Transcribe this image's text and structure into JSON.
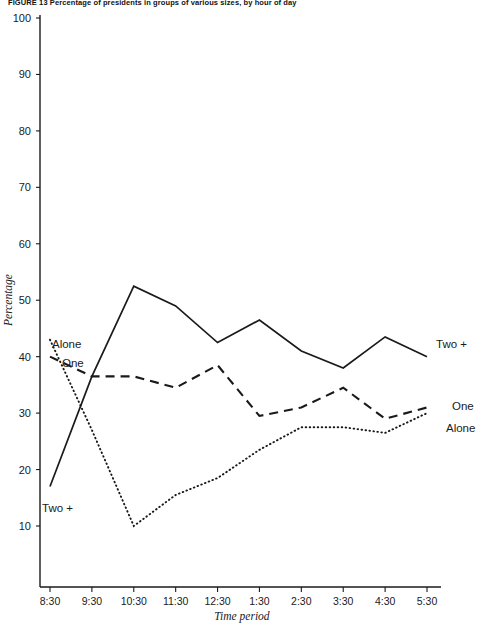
{
  "figure": {
    "caption": "FIGURE 13   Percentage of presidents in groups of various sizes, by hour of day"
  },
  "axes": {
    "y_title": "Percentage",
    "x_title": "Time period",
    "y_ticks": [
      "100",
      "90",
      "80",
      "70",
      "60",
      "50",
      "40",
      "30",
      "20",
      "10"
    ],
    "x_ticks": [
      "8:30",
      "9:30",
      "10:30",
      "11:30",
      "12:30",
      "1:30",
      "2:30",
      "3:30",
      "4:30",
      "5:30"
    ]
  },
  "labels": {
    "alone_left": "Alone",
    "one_left": "One",
    "twoplus_left": "Two +",
    "twoplus_right": "Two +",
    "one_right": "One",
    "alone_right": "Alone"
  },
  "chart_data": {
    "type": "line",
    "title": "FIGURE 13   Percentage of presidents in groups of various sizes, by hour of day",
    "xlabel": "Time period",
    "ylabel": "Percentage",
    "ylim": [
      0,
      100
    ],
    "ytick_step": 10,
    "grid": false,
    "legend": "inline-endpoint-labels",
    "categories": [
      "8:30",
      "9:30",
      "10:30",
      "11:30",
      "12:30",
      "1:30",
      "2:30",
      "3:30",
      "4:30",
      "5:30"
    ],
    "series": [
      {
        "name": "Two +",
        "style": "solid",
        "values": [
          17,
          36.5,
          52.5,
          49,
          42.5,
          46.5,
          41,
          38,
          43.5,
          40
        ]
      },
      {
        "name": "One",
        "style": "dashed",
        "values": [
          40,
          36.5,
          36.5,
          34.5,
          38.5,
          29.5,
          31,
          34.5,
          29,
          31
        ]
      },
      {
        "name": "Alone",
        "style": "dotted",
        "values": [
          43,
          27,
          10,
          15.5,
          18.5,
          23.5,
          27.5,
          27.5,
          26.5,
          30
        ]
      }
    ]
  }
}
